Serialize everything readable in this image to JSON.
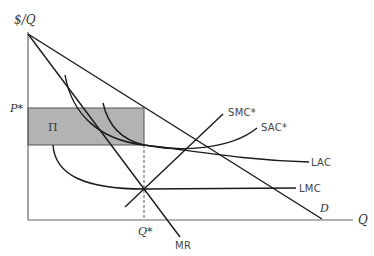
{
  "diagram": {
    "type": "economics-monopoly-long-run-equilibrium",
    "axes": {
      "y_label": "$/Q",
      "x_label": "Q"
    },
    "price_label": "P*",
    "quantity_label": "Q*",
    "profit_label": "Π",
    "curves": {
      "demand": "D",
      "marginal_revenue": "MR",
      "short_run_marginal_cost": "SMC*",
      "short_run_average_cost": "SAC*",
      "long_run_average_cost": "LAC",
      "long_run_marginal_cost": "LMC"
    },
    "colors": {
      "profit_fill": "#b3b3b3",
      "line": "#1a1a1a",
      "axis": "#555555"
    }
  }
}
